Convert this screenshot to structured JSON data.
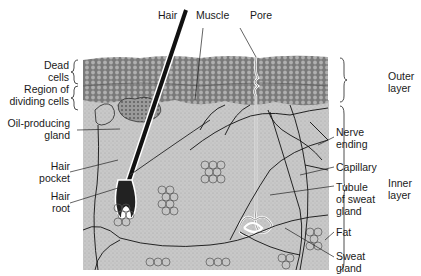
{
  "diagram": {
    "labels": {
      "hair": "Hair",
      "muscle": "Muscle",
      "pore": "Pore",
      "dead_cells": [
        "Dead",
        "cells"
      ],
      "dividing_cells": [
        "Region of",
        "dividing cells"
      ],
      "oil_gland": [
        "Oil-producing",
        "gland"
      ],
      "hair_pocket": [
        "Hair",
        "pocket"
      ],
      "hair_root": [
        "Hair",
        "root"
      ],
      "nerve_ending": [
        "Nerve",
        "ending"
      ],
      "capillary": "Capillary",
      "tubule": [
        "Tubule",
        "of sweat",
        "gland"
      ],
      "fat": "Fat",
      "sweat_gland": [
        "Sweat",
        "gland"
      ],
      "outer_layer": [
        "Outer",
        "layer"
      ],
      "inner_layer": [
        "Inner",
        "layer"
      ]
    },
    "colors": {
      "outer_layer_fill": "#8c8c8c",
      "inner_layer_fill": "#c9c9c9",
      "line": "#1a1a1a",
      "hair": "#111111"
    }
  }
}
